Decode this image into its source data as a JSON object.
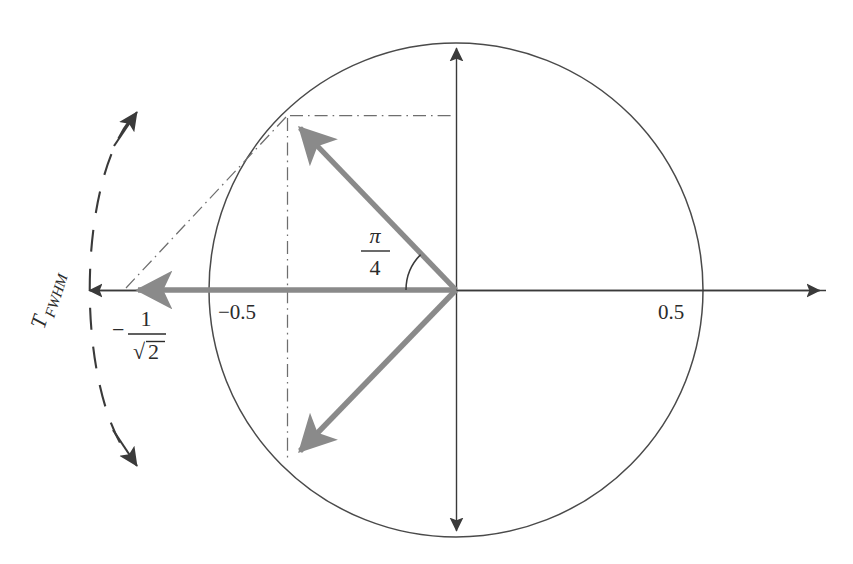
{
  "figure": {
    "width": 853,
    "height": 564,
    "background_color": "#ffffff"
  },
  "colors": {
    "axis": "#3a3a3a",
    "circle": "#4a4a4a",
    "vector_gray": "#8a8a8a",
    "construction": "#6e6e6e",
    "dashed_arc": "#3a3a3a",
    "text": "#2b2b2b"
  },
  "geometry": {
    "center_x": 456,
    "center_y": 290,
    "radius": 247,
    "angle_arc_radius": 50,
    "vector_tip_x": 288,
    "vector_tip_upper_y": 116,
    "vector_tip_lower_y": 463,
    "horizontal_vector_tip_x": 124,
    "axis_left_x": 83,
    "axis_right_x": 826,
    "axis_top_y": 42,
    "axis_bottom_y": 537
  },
  "labels": {
    "tick_negative_half": "−0.5",
    "tick_positive_half": "0.5",
    "angle_numerator": "π",
    "angle_denominator": "4",
    "value_minus_sign": "−",
    "value_numerator": "1",
    "value_denominator_radical": "√",
    "value_denominator_radicand": "2",
    "fwhm_base": "T",
    "fwhm_subscript": "FWHM"
  },
  "elements": {
    "circle_name": "unit-circle",
    "horizontal_axis_name": "horizontal-axis",
    "vertical_axis_name": "vertical-axis",
    "upper_vector_name": "upper-phasor-vector",
    "lower_vector_name": "lower-phasor-vector",
    "horizontal_vector_name": "resultant-vector",
    "angle_arc_name": "angle-arc",
    "dashed_arc_name": "fwhm-span-arc"
  }
}
